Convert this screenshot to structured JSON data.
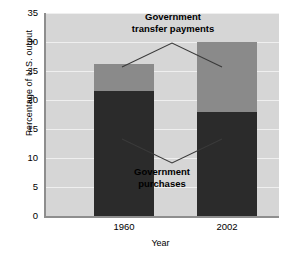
{
  "chart_data": {
    "type": "bar",
    "stacked": true,
    "title": "",
    "xlabel": "Year",
    "ylabel": "Percentage of U.S. output",
    "categories": [
      "1960",
      "2002"
    ],
    "ylim": [
      0,
      35
    ],
    "yticks": [
      0,
      5,
      10,
      15,
      20,
      25,
      30,
      35
    ],
    "ytick_labels": [
      "0",
      "5",
      "10",
      "15",
      "20",
      "25",
      "30",
      "35"
    ],
    "grid": true,
    "legend": "none",
    "series": [
      {
        "name": "Government purchases",
        "color": "#2b2b2b",
        "values": [
          21.5,
          18.0
        ]
      },
      {
        "name": "Government transfer payments",
        "color": "#8a8a8a",
        "values": [
          4.7,
          12.0
        ]
      }
    ],
    "totals": [
      26.2,
      30.0
    ],
    "annotations": [
      {
        "name": "transfer-payments",
        "line1": "Government",
        "line2": "transfer payments"
      },
      {
        "name": "purchases",
        "line1": "Government",
        "line2": "purchases"
      }
    ],
    "colors": {
      "plot_background": "#d6d6d6",
      "gridline": "#efefef",
      "axis": "#8e8e8e",
      "purchases": "#2b2b2b",
      "transfers": "#8a8a8a",
      "leader_line": "#3a3a3a"
    }
  }
}
